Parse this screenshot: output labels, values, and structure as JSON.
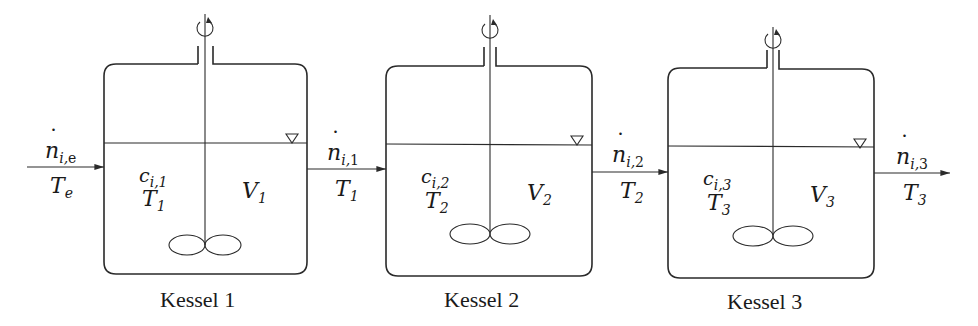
{
  "diagram": {
    "stroke_color": "#2a2a2a",
    "tanks": [
      {
        "id": 1,
        "caption": "Kessel 1",
        "concentration": {
          "symbol": "c",
          "sub": "i,1"
        },
        "temperature": {
          "symbol": "T",
          "sub": "1"
        },
        "volume": {
          "symbol": "V",
          "sub": "1"
        }
      },
      {
        "id": 2,
        "caption": "Kessel 2",
        "concentration": {
          "symbol": "c",
          "sub": "i,2"
        },
        "temperature": {
          "symbol": "T",
          "sub": "2"
        },
        "volume": {
          "symbol": "V",
          "sub": "2"
        }
      },
      {
        "id": 3,
        "caption": "Kessel 3",
        "concentration": {
          "symbol": "c",
          "sub": "i,3"
        },
        "temperature": {
          "symbol": "T",
          "sub": "3"
        },
        "volume": {
          "symbol": "V",
          "sub": "3"
        }
      }
    ],
    "streams": [
      {
        "flow": {
          "symbol": "n",
          "sub_i": "i,",
          "sub_up": "e"
        },
        "temp": {
          "symbol": "T",
          "sub": "e"
        }
      },
      {
        "flow": {
          "symbol": "n",
          "sub_i": "i,",
          "sub_up": "1"
        },
        "temp": {
          "symbol": "T",
          "sub": "1"
        }
      },
      {
        "flow": {
          "symbol": "n",
          "sub_i": "i,",
          "sub_up": "2"
        },
        "temp": {
          "symbol": "T",
          "sub": "2"
        }
      },
      {
        "flow": {
          "symbol": "n",
          "sub_i": "i,",
          "sub_up": "3"
        },
        "temp": {
          "symbol": "T",
          "sub": "3"
        }
      }
    ]
  }
}
